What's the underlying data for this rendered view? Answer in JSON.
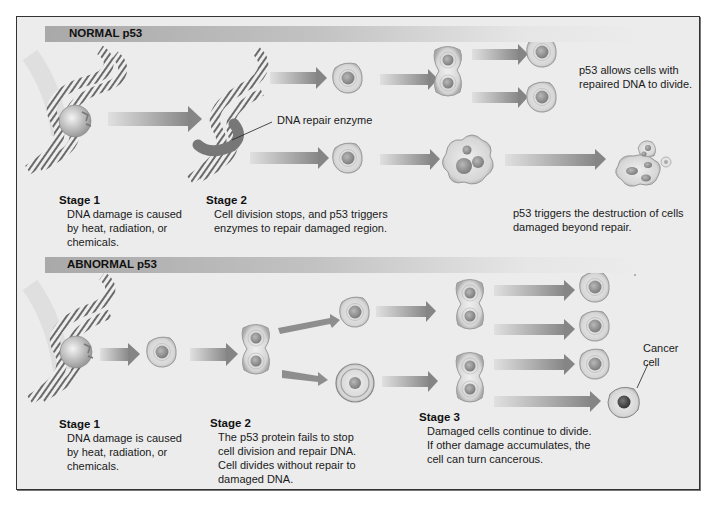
{
  "normal": {
    "header": "NORMAL p53",
    "enzyme_label": "DNA repair enzyme",
    "stage1": {
      "title": "Stage 1",
      "text": "DNA damage is caused\nby heat, radiation, or\nchemicals."
    },
    "stage2": {
      "title": "Stage 2",
      "text": "Cell division stops, and p53 triggers\nenzymes to repair damaged region."
    },
    "outcome_divide": "p53 allows cells with\nrepaired DNA to divide.",
    "outcome_destroy": "p53 triggers the destruction of cells\ndamaged beyond repair."
  },
  "abnormal": {
    "header": "ABNORMAL p53",
    "stage1": {
      "title": "Stage 1",
      "text": "DNA damage is caused\nby heat, radiation, or\nchemicals."
    },
    "stage2": {
      "title": "Stage 2",
      "text": "The p53 protein fails to stop\ncell division and repair DNA.\nCell divides without repair to\ndamaged DNA."
    },
    "stage3": {
      "title": "Stage 3",
      "text": "Damaged cells continue to divide.\nIf other damage accumulates, the\ncell can turn cancerous."
    },
    "cancer_label": "Cancer\ncell"
  },
  "colors": {
    "background": "#ececec",
    "header_bar": "#a9a9a9",
    "arrow": "#8a8a8a",
    "cell_fill": "#dcdcdc",
    "nucleus": "#9a9a9a",
    "cancer_nucleus": "#555555"
  }
}
